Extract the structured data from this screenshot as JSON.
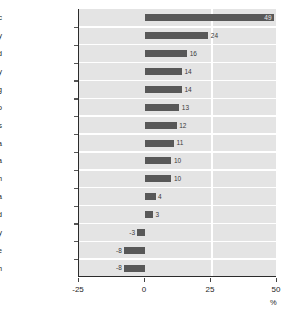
{
  "chart_data": {
    "type": "bar",
    "orientation": "horizontal",
    "title": "",
    "xlabel": "%",
    "ylabel": "",
    "xlim": [
      -25,
      50
    ],
    "xticks": [
      -25,
      0,
      25,
      50
    ],
    "xtick_labels": [
      "-25",
      "0",
      "25",
      "50"
    ],
    "gridlines": [
      "0",
      "25"
    ],
    "grid": true,
    "legend": "none",
    "bar_color": "#585858",
    "plot_background": "#e4e4e4",
    "gridline_color": "#ffffff",
    "categories": [
      "Czech Republic",
      "Turkey",
      "Poland",
      "Italy",
      "Luxembourg",
      "Mexico",
      "United States",
      "Canada",
      "Austria",
      "United Kingdom",
      "Korea",
      "New Zealand",
      "Hungary",
      "Greece",
      "Belgium"
    ],
    "values": [
      49,
      24,
      16,
      14,
      14,
      13,
      12,
      11,
      10,
      10,
      4,
      3,
      -3,
      -8,
      -8
    ],
    "value_labels": [
      "49",
      "24",
      "16",
      "14",
      "14",
      "13",
      "12",
      "11",
      "10",
      "10",
      "4",
      "3",
      "-3",
      "-8",
      "-8"
    ]
  },
  "axis": {
    "unit_label": "%"
  }
}
